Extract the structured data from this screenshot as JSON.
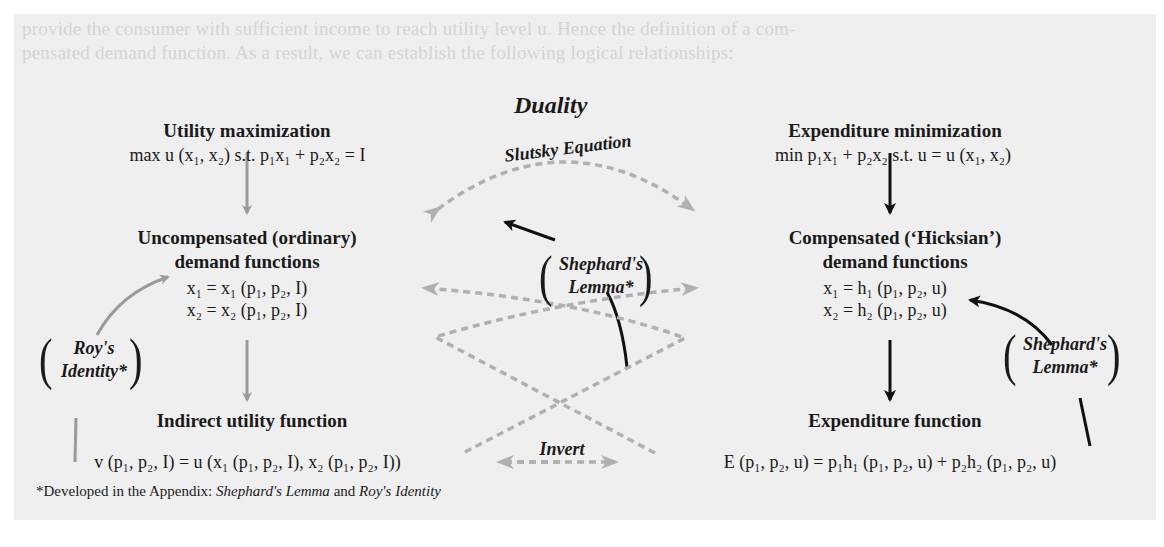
{
  "background_text": {
    "line1": "provide the consumer with sufficient income to reach utility level u. Hence the definition of a com-",
    "line2": "pensated demand function. As a result, we can establish the following logical relationships:"
  },
  "diagram": {
    "title": "Duality",
    "left": {
      "top_heading": "Utility maximization",
      "top_eq": "max u (x₁, x₂)  s.t.  p₁x₁ + p₂x₂ = I",
      "mid_heading_1": "Uncompensated (ordinary)",
      "mid_heading_2": "demand functions",
      "mid_eq_1": "x₁ = x₁ (p₁, p₂, I)",
      "mid_eq_2": "x₂ = x₂ (p₁, p₂, I)",
      "bottom_heading": "Indirect utility function",
      "bottom_eq": "v (p₁, p₂, I) = u (x₁ (p₁, p₂, I), x₂ (p₁, p₂, I))",
      "side_label_1": "Roy's",
      "side_label_2": "Identity*"
    },
    "right": {
      "top_heading": "Expenditure minimization",
      "top_eq": "min p₁x₁ + p₂x₂  s.t.  u = u (x₁, x₂)",
      "mid_heading_1": "Compensated (‘Hicksian’)",
      "mid_heading_2": "demand functions",
      "mid_eq_1": "x₁ = h₁ (p₁, p₂, u)",
      "mid_eq_2": "x₂ = h₂ (p₁, p₂, u)",
      "bottom_heading": "Expenditure function",
      "bottom_eq": "E (p₁, p₂, u) = p₁h₁ (p₁, p₂, u) + p₂h₂ (p₁, p₂, u)",
      "side_label_1": "Shephard's",
      "side_label_2": "Lemma*"
    },
    "center": {
      "slutsky_label": "Slutsky Equation",
      "shephard_label_1": "Shephard's",
      "shephard_label_2": "Lemma*",
      "invert_label": "Invert"
    },
    "footnote": {
      "prefix": "*Developed in the Appendix: ",
      "term1": "Shephard's Lemma",
      "joiner": " and ",
      "term2": "Roy's Identity"
    },
    "colors": {
      "panel_bg": "#efefef",
      "gray_arrow": "#9a9a9a",
      "dashed_arrow": "#b0b0b0",
      "black_arrow": "#111111"
    }
  }
}
